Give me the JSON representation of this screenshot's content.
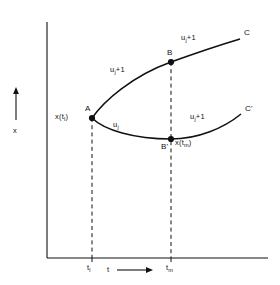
{
  "figure": {
    "background_color": "#ffffff",
    "line_color": "#111111"
  },
  "axes": {
    "y_axis": {
      "label": "x",
      "arrow": "up-arrow-icon",
      "visible": true
    },
    "x_axis": {
      "label": "t",
      "arrow": "right-arrow-icon",
      "visible": true
    },
    "ticks": [
      {
        "id": "tick-left",
        "base": "t",
        "sub": "l"
      },
      {
        "id": "tick-right",
        "base": "t",
        "sub": "m"
      }
    ]
  },
  "points": [
    {
      "id": "A",
      "label": "A",
      "value_label_base": "x(t",
      "value_label_sub": "l",
      "value_label_tail": ")"
    },
    {
      "id": "B",
      "label": "B"
    },
    {
      "id": "Bprime",
      "label": "B'",
      "value_label_base": "x(t",
      "value_label_sub": "m",
      "value_label_tail": ")"
    },
    {
      "id": "C",
      "label": "C"
    },
    {
      "id": "Cprime",
      "label": "C'"
    }
  ],
  "controls": {
    "lower_first": {
      "base": "u",
      "sub": "j"
    },
    "upper_first": {
      "base": "u",
      "sub": "j",
      "tail": "+1"
    },
    "upper_second": {
      "base": "u",
      "sub": "j",
      "tail": "+1"
    },
    "lower_second": {
      "base": "u",
      "sub": "j",
      "tail": "+1"
    }
  },
  "dashed_lines": [
    {
      "id": "dashed-t-l",
      "from_point": "A"
    },
    {
      "id": "dashed-t-m",
      "from_point": "B"
    }
  ]
}
